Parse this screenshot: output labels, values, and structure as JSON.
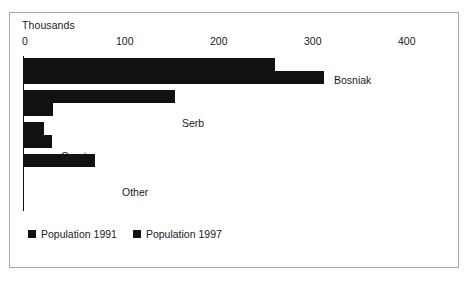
{
  "chart_data": {
    "type": "bar",
    "orientation": "horizontal",
    "title": "",
    "subtitle": "",
    "xlabel": "Thousands",
    "ylabel": "",
    "unit_label": "Thousands",
    "categories": [
      "Bosniak",
      "Serb",
      "Croat",
      "Other"
    ],
    "series": [
      {
        "name": "Population 1991",
        "values": [
          267,
          161,
          21,
          76
        ]
      },
      {
        "name": "Population 1997",
        "values": [
          319,
          31,
          30,
          0
        ]
      }
    ],
    "xlim": [
      0,
      400
    ],
    "xticks": [
      0,
      100,
      200,
      300,
      400
    ],
    "xticklabels": [
      "0",
      "100",
      "200",
      "300",
      "400"
    ],
    "grid": false,
    "legend_position": "bottom-left",
    "bar_color": "#111111",
    "frame_color": "#a8a8a8",
    "background_color": "#ffffff"
  },
  "axis": {
    "unit_label": "Thousands",
    "ticks": [
      {
        "label": "0",
        "left": 22
      },
      {
        "label": "100",
        "left": 116
      },
      {
        "label": "200",
        "left": 210
      },
      {
        "label": "300",
        "left": 304
      },
      {
        "label": "400",
        "left": 398
      }
    ]
  },
  "bars": [
    {
      "name": "bosniak-1991",
      "left": 24,
      "top": 58,
      "width": 251
    },
    {
      "name": "bosniak-1997",
      "left": 24,
      "top": 71,
      "width": 300
    },
    {
      "name": "serb-1991",
      "left": 24,
      "top": 90,
      "width": 151
    },
    {
      "name": "serb-1997",
      "left": 24,
      "top": 103,
      "width": 29
    },
    {
      "name": "croat-1991",
      "left": 24,
      "top": 122,
      "width": 20
    },
    {
      "name": "croat-1997",
      "left": 24,
      "top": 135,
      "width": 28
    },
    {
      "name": "other-1991",
      "left": 24,
      "top": 154,
      "width": 71
    },
    {
      "name": "other-1997",
      "left": 24,
      "top": 167,
      "width": 0
    }
  ],
  "category_labels": [
    {
      "text": "Bosniak",
      "left": 334,
      "top": 74
    },
    {
      "text": "Serb",
      "left": 182,
      "top": 117
    },
    {
      "text": "Croat",
      "left": 61,
      "top": 150
    },
    {
      "text": "Other",
      "left": 122,
      "top": 186
    }
  ],
  "legend": {
    "items": [
      {
        "label": "Population 1991"
      },
      {
        "label": "Population 1997"
      }
    ]
  }
}
